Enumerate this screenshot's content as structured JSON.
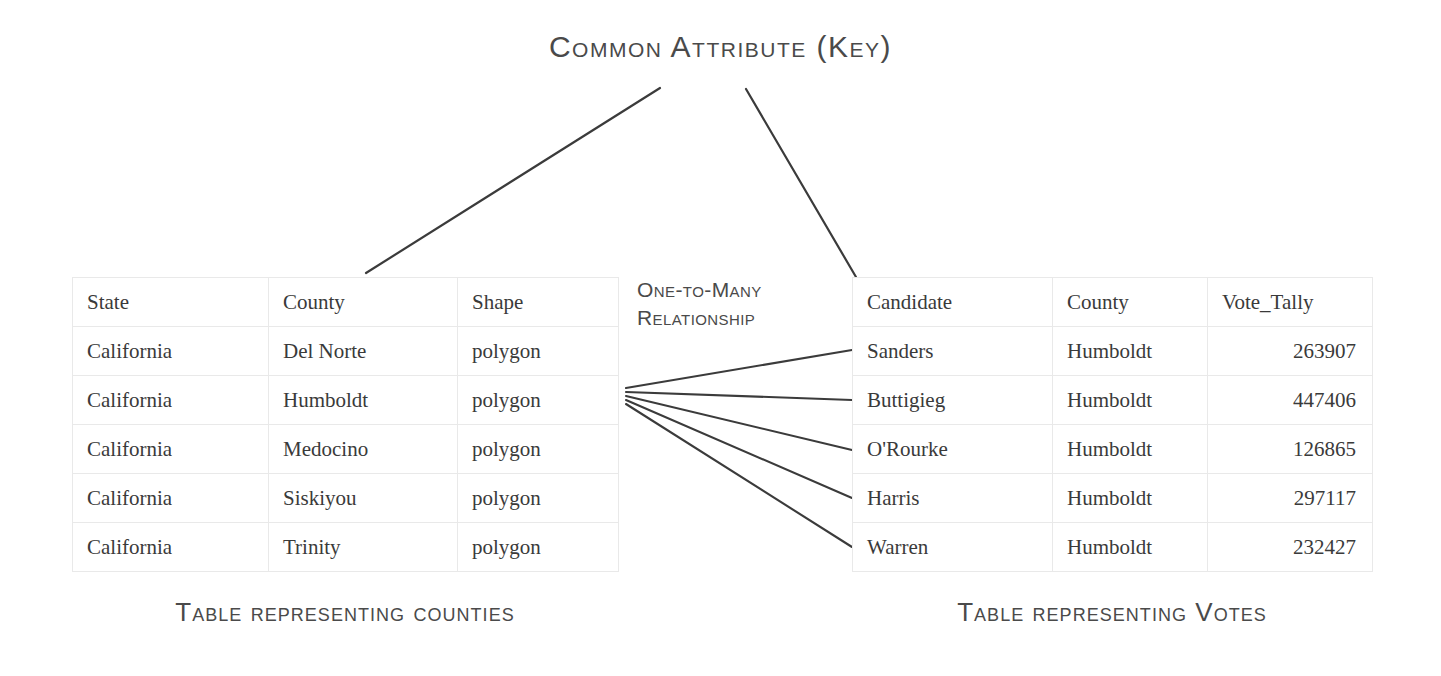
{
  "title": "Common Attribute (Key)",
  "relationship_label": "One-to-Many Relationship",
  "captions": {
    "left": "Table representing counties",
    "right": "Table representing Votes"
  },
  "colors": {
    "background": "#ffffff",
    "text": "#3a3a3a",
    "label_text": "#4a4a4a",
    "table_border": "#e9e9e9",
    "connector_line": "#3b3b3b"
  },
  "counties_table": {
    "name": "counties",
    "headers": [
      "State",
      "County",
      "Shape"
    ],
    "rows": [
      [
        "California",
        "Del Norte",
        "polygon"
      ],
      [
        "California",
        "Humboldt",
        "polygon"
      ],
      [
        "California",
        "Medocino",
        "polygon"
      ],
      [
        "California",
        "Siskiyou",
        "polygon"
      ],
      [
        "California",
        "Trinity",
        "polygon"
      ]
    ]
  },
  "votes_table": {
    "name": "votes",
    "headers": [
      "Candidate",
      "County",
      "Vote_Tally"
    ],
    "rows": [
      [
        "Sanders",
        "Humboldt",
        "263907"
      ],
      [
        "Buttigieg",
        "Humboldt",
        "447406"
      ],
      [
        "O'Rourke",
        "Humboldt",
        "126865"
      ],
      [
        "Harris",
        "Humboldt",
        "297117"
      ],
      [
        "Warren",
        "Humboldt",
        "232427"
      ]
    ]
  }
}
